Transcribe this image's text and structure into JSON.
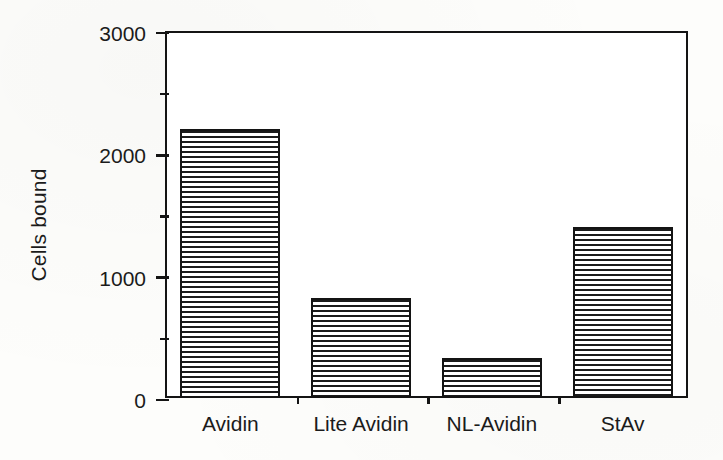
{
  "chart_data": {
    "type": "bar",
    "title": "",
    "xlabel": "",
    "ylabel": "Cells bound",
    "categories": [
      "Avidin",
      "Lite  Avidin",
      "NL-Avidin",
      "StAv"
    ],
    "values": [
      2200,
      820,
      330,
      1400
    ],
    "ylim": [
      0,
      3000
    ],
    "ytick_values": [
      0,
      1000,
      2000,
      3000
    ],
    "ytick_labels": [
      "0",
      "1000",
      "2000",
      "3000"
    ],
    "yminor_tick_values": [
      500,
      1500,
      2500
    ],
    "grid": false,
    "legend": null,
    "bar_fill": "horizontal-line-hatch",
    "colors": {
      "ink": "#141414",
      "paper": "#fdfdfb",
      "bar_fill_line": "#1a1a1a",
      "bar_fill_gap": "#ffffff"
    }
  }
}
